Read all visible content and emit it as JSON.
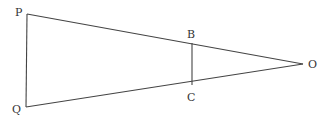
{
  "diagram": {
    "type": "geometry",
    "colors": {
      "stroke": "#444444",
      "label": "#333333",
      "background": "#ffffff"
    },
    "points": {
      "P": {
        "label": "P",
        "x": 27,
        "y": 14,
        "lx": 15,
        "ly": 16
      },
      "Q": {
        "label": "Q",
        "x": 26,
        "y": 107,
        "lx": 12,
        "ly": 113
      },
      "O": {
        "label": "O",
        "x": 303,
        "y": 64,
        "lx": 308,
        "ly": 68
      },
      "B": {
        "label": "B",
        "x": 192,
        "y": 43,
        "lx": 187,
        "ly": 38
      },
      "C": {
        "label": "C",
        "x": 192,
        "y": 85,
        "lx": 187,
        "ly": 101
      }
    },
    "segments": [
      {
        "from": "P",
        "to": "Q"
      },
      {
        "from": "P",
        "to": "O"
      },
      {
        "from": "Q",
        "to": "O"
      },
      {
        "from": "B",
        "to": "C"
      }
    ]
  }
}
